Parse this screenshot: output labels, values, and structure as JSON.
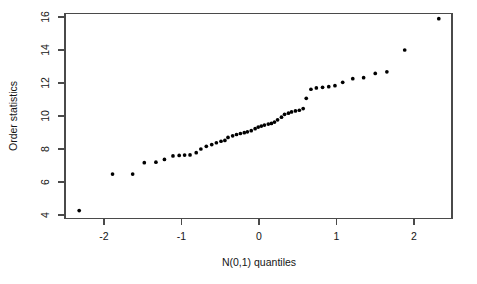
{
  "figure": {
    "title": "",
    "background_color": "#ffffff",
    "frame_color": "#4a4a4a",
    "point_color": "#000000"
  },
  "axes": {
    "x_title": "N(0,1) quantiles",
    "y_title": "Order statistics",
    "x_ticks": [
      "-2",
      "-1",
      "0",
      "1",
      "2"
    ],
    "y_ticks": [
      "4",
      "6",
      "8",
      "10",
      "12",
      "14",
      "16"
    ]
  },
  "chart_data": {
    "type": "scatter",
    "title": "",
    "xlabel": "N(0,1) quantiles",
    "ylabel": "Order statistics",
    "xlim": [
      -2.5,
      2.5
    ],
    "ylim": [
      4.0,
      16.2
    ],
    "xticks": [
      -2,
      -1,
      0,
      1,
      2
    ],
    "yticks": [
      4,
      6,
      8,
      10,
      12,
      14,
      16
    ],
    "grid": false,
    "legend": "none",
    "n_points": 50,
    "x": [
      -2.32,
      -1.89,
      -1.63,
      -1.48,
      -1.33,
      -1.2,
      -1.09,
      -1.0,
      -0.92,
      -0.85,
      -0.78,
      -0.71,
      -0.65,
      -0.58,
      -0.52,
      -0.47,
      -0.41,
      -0.36,
      -0.3,
      -0.25,
      -0.2,
      -0.15,
      -0.1,
      -0.05,
      0.0,
      0.05,
      0.1,
      0.15,
      0.2,
      0.25,
      0.3,
      0.36,
      0.41,
      0.47,
      0.52,
      0.58,
      0.65,
      0.71,
      0.78,
      0.85,
      0.92,
      1.0,
      1.09,
      1.2,
      1.33,
      1.48,
      1.63,
      1.89,
      2.32,
      0.6
    ],
    "y": [
      4.27,
      6.48,
      6.48,
      7.17,
      7.2,
      7.37,
      7.58,
      7.61,
      7.64,
      7.74,
      8.0,
      8.16,
      8.27,
      8.36,
      8.5,
      8.53,
      8.67,
      8.77,
      8.85,
      8.92,
      9.0,
      9.08,
      9.13,
      9.17,
      9.42,
      9.47,
      9.47,
      9.48,
      9.5,
      9.53,
      9.58,
      9.72,
      9.8,
      9.85,
      10.18,
      10.37,
      10.47,
      10.52,
      10.57,
      10.62,
      10.76,
      11.62,
      11.67,
      11.7,
      11.76,
      11.87,
      12.23,
      12.35,
      12.44,
      11.07
    ]
  },
  "points": [
    {
      "x": -2.32,
      "y": 4.27
    },
    {
      "x": -1.89,
      "y": 6.48
    },
    {
      "x": -1.63,
      "y": 6.48
    },
    {
      "x": -1.48,
      "y": 7.17
    },
    {
      "x": -1.33,
      "y": 7.2
    },
    {
      "x": -1.22,
      "y": 7.37
    },
    {
      "x": -1.11,
      "y": 7.58
    },
    {
      "x": -1.03,
      "y": 7.61
    },
    {
      "x": -0.96,
      "y": 7.63
    },
    {
      "x": -0.89,
      "y": 7.64
    },
    {
      "x": -0.81,
      "y": 7.78
    },
    {
      "x": -0.75,
      "y": 8.0
    },
    {
      "x": -0.68,
      "y": 8.16
    },
    {
      "x": -0.61,
      "y": 8.27
    },
    {
      "x": -0.55,
      "y": 8.38
    },
    {
      "x": -0.49,
      "y": 8.47
    },
    {
      "x": -0.44,
      "y": 8.52
    },
    {
      "x": -0.4,
      "y": 8.7
    },
    {
      "x": -0.34,
      "y": 8.8
    },
    {
      "x": -0.29,
      "y": 8.88
    },
    {
      "x": -0.24,
      "y": 8.94
    },
    {
      "x": -0.19,
      "y": 8.99
    },
    {
      "x": -0.15,
      "y": 9.04
    },
    {
      "x": -0.1,
      "y": 9.11
    },
    {
      "x": -0.05,
      "y": 9.23
    },
    {
      "x": -0.01,
      "y": 9.33
    },
    {
      "x": 0.03,
      "y": 9.39
    },
    {
      "x": 0.07,
      "y": 9.45
    },
    {
      "x": 0.12,
      "y": 9.51
    },
    {
      "x": 0.16,
      "y": 9.55
    },
    {
      "x": 0.2,
      "y": 9.63
    },
    {
      "x": 0.24,
      "y": 9.77
    },
    {
      "x": 0.29,
      "y": 9.93
    },
    {
      "x": 0.33,
      "y": 10.1
    },
    {
      "x": 0.38,
      "y": 10.17
    },
    {
      "x": 0.42,
      "y": 10.25
    },
    {
      "x": 0.47,
      "y": 10.31
    },
    {
      "x": 0.52,
      "y": 10.35
    },
    {
      "x": 0.57,
      "y": 10.45
    },
    {
      "x": 0.61,
      "y": 11.07
    },
    {
      "x": 0.67,
      "y": 11.62
    },
    {
      "x": 0.74,
      "y": 11.7
    },
    {
      "x": 0.82,
      "y": 11.74
    },
    {
      "x": 0.9,
      "y": 11.78
    },
    {
      "x": 0.98,
      "y": 11.84
    },
    {
      "x": 1.08,
      "y": 12.04
    },
    {
      "x": 1.21,
      "y": 12.26
    },
    {
      "x": 1.35,
      "y": 12.32
    },
    {
      "x": 1.5,
      "y": 12.58
    },
    {
      "x": 1.65,
      "y": 12.68
    },
    {
      "x": 1.88,
      "y": 14.0
    },
    {
      "x": 2.32,
      "y": 15.9
    }
  ]
}
